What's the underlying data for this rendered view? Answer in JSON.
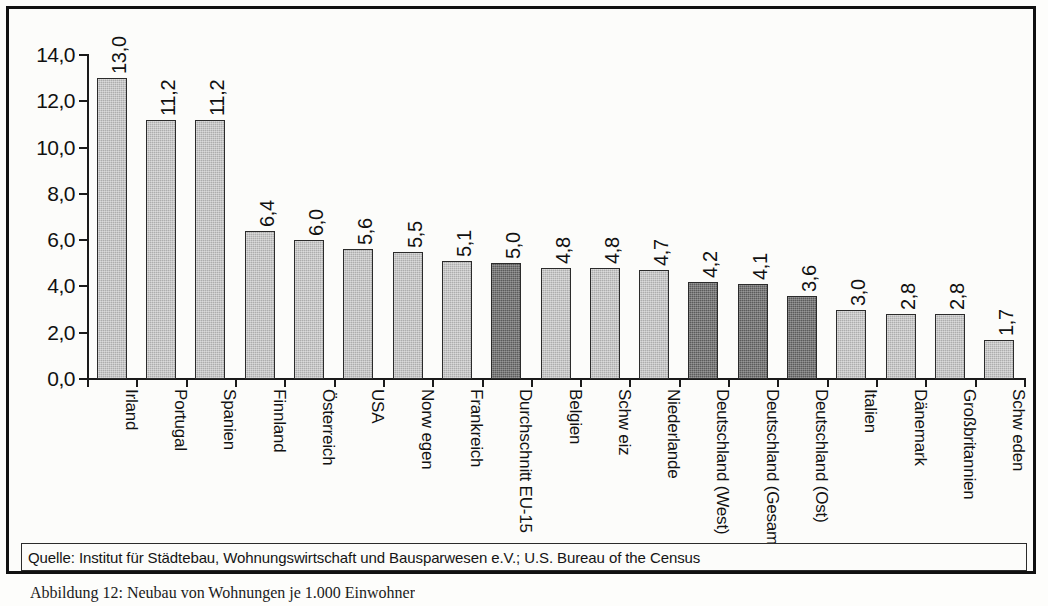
{
  "source_note": "Quelle: Institut für Städtebau, Wohnungswirtschaft und Bausparwesen e.V.; U.S. Bureau of the Census",
  "figure_caption": "Abbildung 12: Neubau von Wohnungen je 1.000 Einwohner",
  "colors": {
    "bar_light": "#adadad",
    "bar_dark": "#5b5b5b",
    "bar_border": "#2b2b2b",
    "frame": "#111111",
    "background": "#fcfcfa"
  },
  "chart_data": {
    "type": "bar",
    "title": "",
    "subtitle": "",
    "xlabel": "",
    "ylabel": "",
    "ylim": [
      0,
      14
    ],
    "grid": false,
    "legend": "none",
    "y_ticks": [
      "0,0",
      "2,0",
      "4,0",
      "6,0",
      "8,0",
      "10,0",
      "12,0",
      "14,0"
    ],
    "y_tick_values": [
      0,
      2,
      4,
      6,
      8,
      10,
      12,
      14
    ],
    "categories": [
      "Irland",
      "Portugal",
      "Spanien",
      "Finnland",
      "Österreich",
      "USA",
      "Norw egen",
      "Frankreich",
      "Durchschnitt EU-15",
      "Belgien",
      "Schw eiz",
      "Niederlande",
      "Deutschland (West)",
      "Deutschland (Gesamt)",
      "Deutschland (Ost)",
      "Italien",
      "Dänemark",
      "Großbritannien",
      "Schw eden"
    ],
    "values": [
      13.0,
      11.2,
      11.2,
      6.4,
      6.0,
      5.6,
      5.5,
      5.1,
      5.0,
      4.8,
      4.8,
      4.7,
      4.2,
      4.1,
      3.6,
      3.0,
      2.8,
      2.8,
      1.7
    ],
    "value_labels": [
      "13,0",
      "11,2",
      "11,2",
      "6,4",
      "6,0",
      "5,6",
      "5,5",
      "5,1",
      "5,0",
      "4,8",
      "4,8",
      "4,7",
      "4,2",
      "4,1",
      "3,6",
      "3,0",
      "2,8",
      "2,8",
      "1,7"
    ],
    "bar_styles": [
      "light",
      "light",
      "light",
      "light",
      "light",
      "light",
      "light",
      "light",
      "dark",
      "light",
      "light",
      "light",
      "dark",
      "dark",
      "dark",
      "light",
      "light",
      "light",
      "light"
    ]
  }
}
